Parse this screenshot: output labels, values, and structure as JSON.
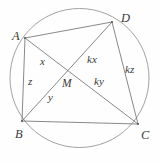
{
  "figure": {
    "canvas": {
      "width": 161,
      "height": 162
    },
    "colors": {
      "background": "#fefefe",
      "chord_stroke": "#6b6b6b",
      "circle_stroke": "#8a8a8a",
      "label_text": "#3a3a3a"
    },
    "circle": {
      "cx": 79.5,
      "cy": 78,
      "r": 69.5
    },
    "vertices": [
      {
        "id": "A",
        "label": "A",
        "x": 25,
        "y": 38,
        "label_x": 12,
        "label_y": 30
      },
      {
        "id": "D",
        "label": "D",
        "x": 112,
        "y": 22,
        "label_x": 121,
        "label_y": 12
      },
      {
        "id": "C",
        "label": "C",
        "x": 138,
        "y": 124,
        "label_x": 141,
        "label_y": 129
      },
      {
        "id": "B",
        "label": "B",
        "x": 22,
        "y": 121,
        "label_x": 15,
        "label_y": 128
      }
    ],
    "interior_point": {
      "id": "M",
      "label": "M",
      "x": 70,
      "y": 72,
      "label_x": 62,
      "label_y": 78
    },
    "chords": [
      {
        "id": "AD",
        "from": "A",
        "to": "D"
      },
      {
        "id": "AB",
        "from": "A",
        "to": "B"
      },
      {
        "id": "BC",
        "from": "B",
        "to": "C"
      },
      {
        "id": "DC",
        "from": "D",
        "to": "C"
      },
      {
        "id": "AC",
        "from": "A",
        "to": "C"
      },
      {
        "id": "BD",
        "from": "B",
        "to": "D"
      }
    ],
    "segment_labels": [
      {
        "id": "x",
        "label": "x",
        "x": 40,
        "y": 56,
        "segment": "AM"
      },
      {
        "id": "z",
        "label": "z",
        "x": 28,
        "y": 76,
        "segment": "AB"
      },
      {
        "id": "y",
        "label": "y",
        "x": 48,
        "y": 92,
        "segment": "BM"
      },
      {
        "id": "kx",
        "label": "kx",
        "x": 87,
        "y": 54,
        "segment": "MD"
      },
      {
        "id": "ky",
        "label": "ky",
        "x": 94,
        "y": 76,
        "segment": "MC"
      },
      {
        "id": "kz",
        "label": "kz",
        "x": 125,
        "y": 64,
        "segment": "DC"
      }
    ]
  }
}
